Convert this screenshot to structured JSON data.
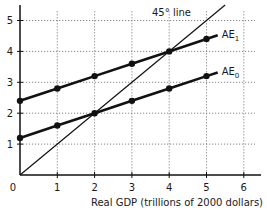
{
  "chart_data": {
    "type": "line",
    "title": "",
    "xlabel": "Real GDP (trillions of 2000 dollars)",
    "ylabel": "",
    "xlim": [
      0,
      6.4
    ],
    "ylim": [
      0,
      5.3
    ],
    "x_ticks": [
      "0",
      "1",
      "2",
      "3",
      "4",
      "5",
      "6"
    ],
    "y_ticks": [
      "1",
      "2",
      "3",
      "4",
      "5"
    ],
    "grid": true,
    "series": [
      {
        "name": "AE1",
        "label_main": "AE",
        "label_sub": "1",
        "x": [
          0,
          1,
          2,
          3,
          4,
          5
        ],
        "y": [
          2.4,
          2.8,
          3.2,
          3.6,
          4.0,
          4.4
        ],
        "markers": true
      },
      {
        "name": "AE0",
        "label_main": "AE",
        "label_sub": "0",
        "x": [
          0,
          1,
          2,
          3,
          4,
          5
        ],
        "y": [
          1.2,
          1.6,
          2.0,
          2.4,
          2.8,
          3.2
        ],
        "markers": true
      },
      {
        "name": "45° line",
        "x": [
          0,
          5.5
        ],
        "y": [
          0,
          5.5
        ],
        "markers": false
      }
    ],
    "annotations": [
      {
        "text": "45° line",
        "x": 3.6,
        "y": 4.85
      }
    ],
    "colors": {
      "line": "#111111",
      "grid": "#666666",
      "axis": "#111111"
    }
  }
}
